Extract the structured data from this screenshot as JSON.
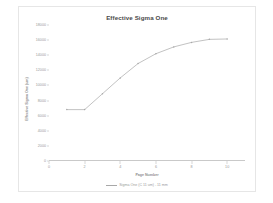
{
  "chart_data": {
    "type": "line",
    "title": "Effective Sigma One",
    "xlabel": "Page Number",
    "ylabel": "Effective Sigma One (um)",
    "xlim": [
      0,
      11
    ],
    "ylim": [
      0,
      18000
    ],
    "xticks": [
      0,
      2,
      4,
      6,
      8,
      10
    ],
    "xtick_labels": [
      "0",
      "2",
      "4",
      "6",
      "8",
      "10"
    ],
    "yticks": [
      0,
      2000,
      4000,
      6000,
      8000,
      10000,
      12000,
      14000,
      16000,
      18000
    ],
    "ytick_labels": [
      "0",
      "2000",
      "4000",
      "6000",
      "8000",
      "10000",
      "12000",
      "14000",
      "16000",
      "18000"
    ],
    "grid": false,
    "legend_position": "bottom",
    "series": [
      {
        "name": "Sigma One (C 11 um) - 11 mm",
        "color": "#a8a8a8",
        "marker": "dot",
        "x": [
          1,
          2,
          3,
          4,
          5,
          6,
          7,
          8,
          9,
          10
        ],
        "values": [
          6800,
          6800,
          8900,
          11000,
          12900,
          14200,
          15100,
          15700,
          16100,
          16150
        ]
      }
    ]
  },
  "legend": {
    "entry_label": "Sigma One (C 11 um) - 11 mm",
    "swatch_color": "#a8a8a8"
  },
  "colors": {
    "line": "#a8a8a8",
    "axis": "#c9c9c9",
    "tick_text": "#9a9a9a",
    "title_text": "#4a4a4a",
    "frame_border": "#e6e6e6",
    "background": "#ffffff"
  }
}
